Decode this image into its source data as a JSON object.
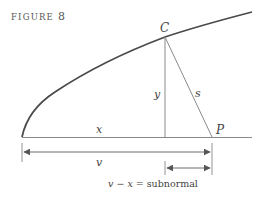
{
  "figure": {
    "title": "FIGURE",
    "number": "8"
  },
  "labels": {
    "C": "C",
    "P": "P",
    "y": "y",
    "s": "s",
    "x": "x",
    "v": "v"
  },
  "caption": {
    "lhs_v": "v",
    "minus": " − ",
    "lhs_x": "x",
    "equals": " = ",
    "rhs": "subnormal"
  },
  "colors": {
    "curve": "#4a4a4a",
    "lines": "#8a8a8a",
    "arrows": "#6a6a6a",
    "text": "#444444"
  },
  "geometry": {
    "origin": [
      22,
      137
    ],
    "point_C": [
      165,
      37
    ],
    "point_P": [
      212,
      137
    ],
    "foot_of_y": [
      165,
      137
    ],
    "curve_end": [
      252,
      12
    ],
    "baseline_end": [
      252,
      137
    ]
  }
}
